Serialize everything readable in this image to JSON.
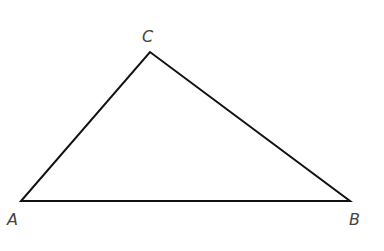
{
  "diagram": {
    "type": "triangle",
    "vertices": [
      {
        "label": "A",
        "x": 21,
        "y": 201,
        "label_x": 7,
        "label_y": 225
      },
      {
        "label": "B",
        "x": 350,
        "y": 201,
        "label_x": 349,
        "label_y": 225
      },
      {
        "label": "C",
        "x": 150,
        "y": 52,
        "label_x": 142,
        "label_y": 42
      }
    ],
    "edges": [
      [
        "A",
        "B"
      ],
      [
        "B",
        "C"
      ],
      [
        "C",
        "A"
      ]
    ],
    "stroke_color": "#111111"
  }
}
